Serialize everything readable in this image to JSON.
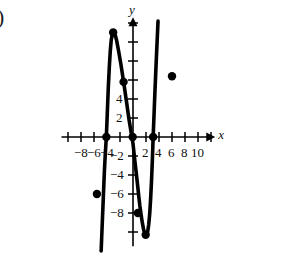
{
  "figure": {
    "corner_marker": ")",
    "axis_labels": {
      "x": "x",
      "y": "y"
    },
    "origin_px": {
      "x": 133,
      "y": 137
    },
    "scale_px_per_unit": {
      "x": 6.5,
      "y": 9.5
    }
  },
  "chart_data": {
    "type": "line",
    "title": "",
    "xlabel": "x",
    "ylabel": "y",
    "grid": false,
    "legend": null,
    "xlim": [
      -11,
      12.5
    ],
    "ylim": [
      -11.5,
      12.5
    ],
    "xticks": [
      -10,
      -8,
      -6,
      -4,
      -2,
      2,
      4,
      6,
      8,
      10,
      12
    ],
    "yticks": [
      -10,
      -8,
      -6,
      -4,
      -2,
      2,
      4,
      6,
      8,
      10,
      12
    ],
    "xtick_labels": [
      {
        "value": -8,
        "text": "−8"
      },
      {
        "value": -6,
        "text": "−6"
      },
      {
        "value": -4,
        "text": "−4"
      },
      {
        "value": 2,
        "text": "2"
      },
      {
        "value": 4,
        "text": "4"
      },
      {
        "value": 6,
        "text": "6"
      },
      {
        "value": 8,
        "text": "8"
      },
      {
        "value": 10,
        "text": "10"
      }
    ],
    "ytick_labels": [
      {
        "value": 4,
        "text": "4"
      },
      {
        "value": 2,
        "text": "2"
      },
      {
        "value": -2,
        "text": "−2"
      },
      {
        "value": -4,
        "text": "−4"
      },
      {
        "value": -6,
        "text": "−6"
      },
      {
        "value": -8,
        "text": "−8"
      }
    ],
    "curve": [
      [
        -4.9,
        -12.0
      ],
      [
        -4.7,
        -8.6
      ],
      [
        -4.55,
        -6.1
      ],
      [
        -4.4,
        -3.6
      ],
      [
        -4.25,
        -1.6
      ],
      [
        -4.1,
        0.0
      ],
      [
        -3.95,
        2.6
      ],
      [
        -3.8,
        5.2
      ],
      [
        -3.65,
        7.3
      ],
      [
        -3.5,
        9.0
      ],
      [
        -3.35,
        10.2
      ],
      [
        -3.15,
        10.9
      ],
      [
        -2.95,
        11.05
      ],
      [
        -2.75,
        10.8
      ],
      [
        -2.5,
        10.1
      ],
      [
        -2.2,
        9.0
      ],
      [
        -1.85,
        7.6
      ],
      [
        -1.4,
        5.6
      ],
      [
        -1.0,
        3.7
      ],
      [
        -0.6,
        1.8
      ],
      [
        -0.2,
        0.1
      ],
      [
        0.0,
        -0.7
      ],
      [
        0.3,
        -2.6
      ],
      [
        0.6,
        -4.4
      ],
      [
        0.85,
        -6.0
      ],
      [
        1.05,
        -7.2
      ],
      [
        1.25,
        -8.2
      ],
      [
        1.45,
        -9.1
      ],
      [
        1.65,
        -9.8
      ],
      [
        1.85,
        -10.2
      ],
      [
        2.05,
        -10.3
      ],
      [
        2.25,
        -10.0
      ],
      [
        2.42,
        -9.2
      ],
      [
        2.58,
        -8.0
      ],
      [
        2.72,
        -6.4
      ],
      [
        2.85,
        -4.6
      ],
      [
        2.98,
        -2.4
      ],
      [
        3.1,
        0.0
      ],
      [
        3.25,
        2.6
      ],
      [
        3.4,
        5.2
      ],
      [
        3.55,
        7.6
      ],
      [
        3.7,
        9.9
      ],
      [
        3.85,
        12.2
      ]
    ],
    "points": [
      {
        "x": -4.1,
        "y": 0.0
      },
      {
        "x": -3.05,
        "y": 11.0
      },
      {
        "x": -1.45,
        "y": 5.8
      },
      {
        "x": -0.05,
        "y": 0.0
      },
      {
        "x": 3.1,
        "y": 0.0
      },
      {
        "x": 6.0,
        "y": 6.4
      },
      {
        "x": -5.55,
        "y": -6.0
      },
      {
        "x": 0.75,
        "y": -8.0
      },
      {
        "x": 1.95,
        "y": -10.3
      }
    ]
  }
}
